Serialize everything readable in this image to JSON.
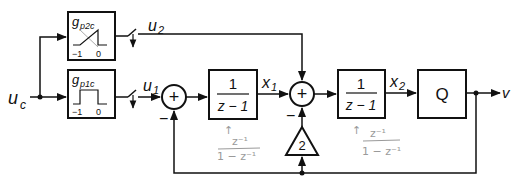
{
  "diagram": {
    "type": "block-diagram",
    "input": {
      "label_main": "u",
      "label_sub": "c"
    },
    "output": {
      "label": "v"
    },
    "blocks": {
      "gp2c": {
        "label_main": "g",
        "label_sub": "p2c",
        "axis_left": "−1",
        "axis_right": "0",
        "shape": "ramp"
      },
      "gp1c": {
        "label_main": "g",
        "label_sub": "p1c",
        "axis_left": "−1",
        "axis_right": "0",
        "shape": "pulse"
      },
      "integrator1": {
        "numerator": "1",
        "denominator": "z − 1"
      },
      "integrator2": {
        "numerator": "1",
        "denominator": "z − 1"
      },
      "quantizer": {
        "label": "Q"
      },
      "gain": {
        "label": "2"
      }
    },
    "signals": {
      "u1": {
        "main": "u",
        "sub": "1"
      },
      "u2": {
        "main": "u",
        "sub": "2"
      },
      "x1": {
        "main": "x",
        "sub": "1"
      },
      "x2": {
        "main": "x",
        "sub": "2"
      }
    },
    "summers": {
      "sum1": {
        "symbol": "+",
        "minus_sign": "−"
      },
      "sum2": {
        "symbol": "+",
        "minus_sign": "−"
      }
    },
    "annotations": {
      "note1": {
        "arrow": "↑",
        "numerator": "z⁻¹",
        "denominator": "1 − z⁻¹"
      },
      "note2": {
        "arrow": "↑",
        "numerator": "z⁻¹",
        "denominator": "1 − z⁻¹"
      }
    },
    "colors": {
      "line": "#111111",
      "pencil": "#9a9a9a",
      "background": "#ffffff"
    }
  }
}
